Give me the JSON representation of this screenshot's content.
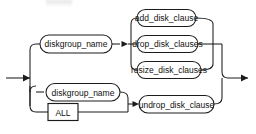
{
  "diagram": {
    "type": "railroad-syntax-diagram",
    "entry_arrow": "right-arrow",
    "exit_arrow": "right-arrow",
    "branches": [
      {
        "id": "upper",
        "nodes": [
          {
            "id": "diskgroup_name_top",
            "label": "diskgroup_name",
            "shape": "pill",
            "kind": "nonterminal"
          }
        ],
        "choices": [
          {
            "id": "add_disk_clause",
            "label": "add_disk_clause",
            "shape": "pill",
            "kind": "nonterminal"
          },
          {
            "id": "drop_disk_clauses",
            "label": "drop_disk_clauses",
            "shape": "pill",
            "kind": "nonterminal"
          },
          {
            "id": "resize_disk_clauses",
            "label": "resize_disk_clauses",
            "shape": "pill",
            "kind": "nonterminal"
          }
        ]
      },
      {
        "id": "lower",
        "choices": [
          {
            "id": "diskgroup_name_bottom",
            "label": "diskgroup_name",
            "shape": "pill",
            "kind": "nonterminal"
          },
          {
            "id": "all_keyword",
            "label": "ALL",
            "shape": "rect",
            "kind": "keyword"
          }
        ],
        "nodes": [
          {
            "id": "undrop_disk_clause",
            "label": "undrop_disk_clause",
            "shape": "pill",
            "kind": "nonterminal"
          }
        ]
      }
    ],
    "colors": {
      "stroke": "#1c1c1c",
      "fill": "#ffffff",
      "text": "#111111",
      "background": "#ffffff"
    }
  }
}
